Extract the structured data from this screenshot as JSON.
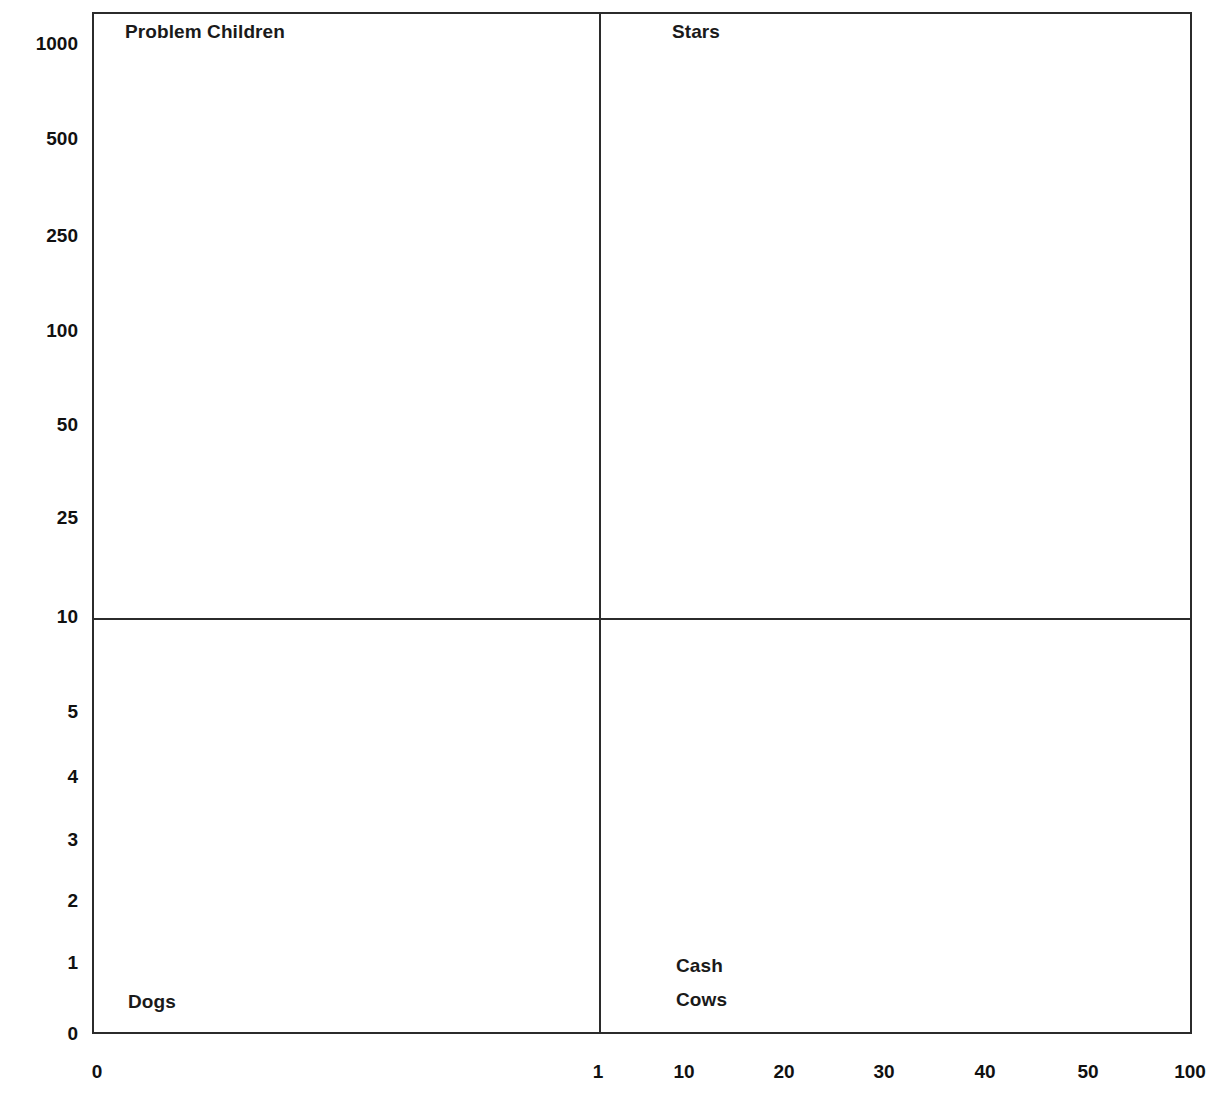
{
  "chart_data": {
    "type": "scatter",
    "title": "",
    "subtitle": "",
    "xlabel": "",
    "ylabel": "",
    "grid": false,
    "legend_position": "none",
    "quadrants": [
      {
        "name": "problem-children",
        "label": "Problem Children",
        "position": "top-left",
        "x_px": 125,
        "y_px": 32
      },
      {
        "name": "stars",
        "label": "Stars",
        "position": "top-right",
        "x_px": 672,
        "y_px": 32
      },
      {
        "name": "dogs",
        "label": "Dogs",
        "position": "bottom-left",
        "x_px": 128,
        "y_px": 1002
      },
      {
        "name": "cash-cows",
        "label": "Cash\nCows",
        "position": "bottom-right",
        "x_px": 676,
        "y_px": 966
      }
    ],
    "quadrant_labels": {
      "problem_children": "Problem Children",
      "stars": "Stars",
      "dogs": "Dogs",
      "cash_cows_line1": "Cash",
      "cash_cows_line2": "Cows"
    },
    "y_ticks": [
      {
        "label": "1000",
        "value": 1000,
        "y_px": 44
      },
      {
        "label": "500",
        "value": 500,
        "y_px": 139
      },
      {
        "label": "250",
        "value": 250,
        "y_px": 236
      },
      {
        "label": "100",
        "value": 100,
        "y_px": 331
      },
      {
        "label": "50",
        "value": 50,
        "y_px": 425
      },
      {
        "label": "25",
        "value": 25,
        "y_px": 518
      },
      {
        "label": "10",
        "value": 10,
        "y_px": 617
      },
      {
        "label": "5",
        "value": 5,
        "y_px": 712
      },
      {
        "label": "4",
        "value": 4,
        "y_px": 777
      },
      {
        "label": "3",
        "value": 3,
        "y_px": 840
      },
      {
        "label": "2",
        "value": 2,
        "y_px": 901
      },
      {
        "label": "1",
        "value": 1,
        "y_px": 963
      },
      {
        "label": "0",
        "value": 0,
        "y_px": 1034
      }
    ],
    "x_ticks": [
      {
        "label": "0",
        "value": 0,
        "x_px": 97
      },
      {
        "label": "1",
        "value": 1,
        "x_px": 598
      },
      {
        "label": "10",
        "value": 10,
        "x_px": 684
      },
      {
        "label": "20",
        "value": 20,
        "x_px": 784
      },
      {
        "label": "30",
        "value": 30,
        "x_px": 884
      },
      {
        "label": "40",
        "value": 40,
        "x_px": 985
      },
      {
        "label": "50",
        "value": 50,
        "x_px": 1088
      },
      {
        "label": "100",
        "value": 100,
        "x_px": 1190
      }
    ],
    "divider_x_value": 1,
    "divider_y_value": 10,
    "series": [],
    "values": [],
    "categories": []
  },
  "colors": {
    "frame": "#2b2b2b",
    "divider": "#2b2b2b",
    "text": "#111111",
    "background": "#ffffff"
  }
}
